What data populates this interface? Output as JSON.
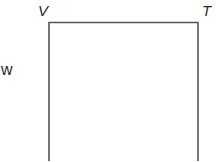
{
  "diagram": {
    "type": "geometry-rectangle-partial",
    "vertices": [
      {
        "label": "V",
        "position": "top-left"
      },
      {
        "label": "T",
        "position": "top-right"
      }
    ],
    "sides": [
      {
        "label": "w",
        "position": "left"
      }
    ],
    "colors": {
      "stroke": "#555555",
      "text": "#2a2a2a",
      "background": "#ffffff"
    }
  }
}
